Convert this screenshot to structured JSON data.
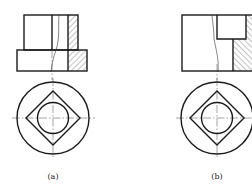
{
  "figure": {
    "views": [
      {
        "id": "a",
        "label": "(a)",
        "description": "front view half-section with hatching on right, top view with circle-diamond-circle"
      },
      {
        "id": "b",
        "label": "(b)",
        "description": "front view with stepped section hatching on right, top view with circle-diamond-circle"
      }
    ],
    "colors": {
      "line": "#1a1a1a",
      "background": "#ffffff"
    }
  }
}
